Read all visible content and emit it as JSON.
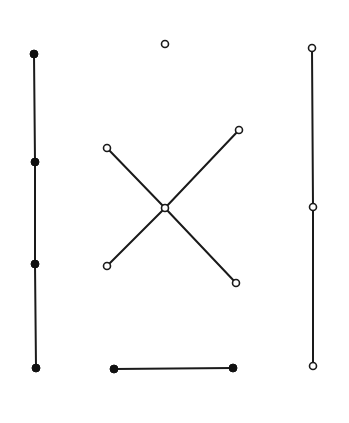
{
  "diagram": {
    "type": "graph",
    "colors": {
      "ink": "#1a1a1a",
      "background": "#ffffff"
    },
    "components": [
      {
        "id": "left-path",
        "node_style": "filled",
        "nodes": [
          "L1",
          "L2",
          "L3",
          "L4"
        ],
        "edges": [
          [
            "L1",
            "L2"
          ],
          [
            "L2",
            "L3"
          ],
          [
            "L3",
            "L4"
          ]
        ]
      },
      {
        "id": "isolated-vertex",
        "node_style": "open",
        "nodes": [
          "I1"
        ],
        "edges": []
      },
      {
        "id": "star",
        "node_style": "open",
        "nodes": [
          "C",
          "S1",
          "S2",
          "S3",
          "S4"
        ],
        "edges": [
          [
            "C",
            "S1"
          ],
          [
            "C",
            "S2"
          ],
          [
            "C",
            "S3"
          ],
          [
            "C",
            "S4"
          ]
        ]
      },
      {
        "id": "bottom-edge",
        "node_style": "filled",
        "nodes": [
          "B1",
          "B2"
        ],
        "edges": [
          [
            "B1",
            "B2"
          ]
        ]
      },
      {
        "id": "right-path",
        "node_style": "open",
        "nodes": [
          "R1",
          "R2",
          "R3"
        ],
        "edges": [
          [
            "R1",
            "R2"
          ],
          [
            "R2",
            "R3"
          ]
        ]
      }
    ]
  }
}
